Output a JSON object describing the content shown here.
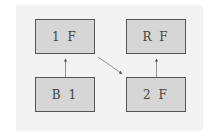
{
  "diagram": {
    "nodes": [
      {
        "id": "1F",
        "label": "1 F"
      },
      {
        "id": "RF",
        "label": "R F"
      },
      {
        "id": "B1",
        "label": "B 1"
      },
      {
        "id": "2F",
        "label": "2 F"
      }
    ],
    "edges": [
      {
        "from": "B1",
        "to": "1F"
      },
      {
        "from": "1F",
        "to": "2F"
      },
      {
        "from": "2F",
        "to": "RF"
      }
    ]
  },
  "colors": {
    "box_fill": "#d6d6d6",
    "box_border": "#555555",
    "background": "#f3f3f3",
    "arrow": "#555555"
  }
}
